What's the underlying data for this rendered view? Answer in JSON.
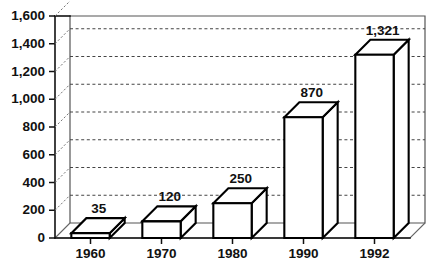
{
  "chart_data": {
    "type": "bar",
    "title": "",
    "subtitle": "",
    "xlabel": "",
    "ylabel": "",
    "categories": [
      "1960",
      "1970",
      "1980",
      "1990",
      "1992"
    ],
    "values": [
      35,
      120,
      250,
      870,
      1321
    ],
    "value_labels": [
      "35",
      "120",
      "250",
      "870",
      "1,321"
    ],
    "ylim": [
      0,
      1600
    ],
    "ytick_values": [
      0,
      200,
      400,
      600,
      800,
      1000,
      1200,
      1400,
      1600
    ],
    "ytick_labels": [
      "0",
      "200",
      "400",
      "600",
      "800",
      "1,000",
      "1,200",
      "1,400",
      "1,600"
    ],
    "gridlines": true,
    "gridline_values": [
      200,
      400,
      600,
      800,
      1000,
      1200,
      1400
    ],
    "legend": [],
    "legend_position": "none",
    "style": {
      "projection": "3d-isometric",
      "bar_fill": "#ffffff",
      "bar_stroke": "#000000",
      "grid_color": "#444444",
      "axis_color": "#111111",
      "background": "#ffffff"
    }
  }
}
